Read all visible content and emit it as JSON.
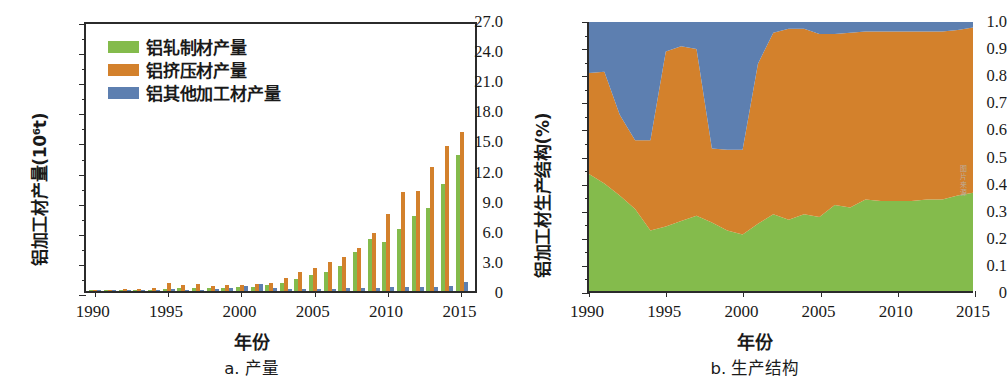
{
  "figure": {
    "series_colors": {
      "rolled": "#84bb4c",
      "extruded": "#d3812c",
      "other": "#5d7fb0"
    },
    "axis_color": "#2b2b2b",
    "watermark": "图片来源"
  },
  "legend": {
    "items": [
      {
        "label": "铝轧制材产量",
        "color_key": "rolled",
        "icon": "legend-swatch"
      },
      {
        "label": "铝挤压材产量",
        "color_key": "extruded",
        "icon": "legend-swatch"
      },
      {
        "label": "铝其他加工材产量",
        "color_key": "other",
        "icon": "legend-swatch"
      }
    ]
  },
  "panel_a": {
    "caption": "a. 产量",
    "xlabel": "年份",
    "ylabel": "铝加工材产量(10⁶t)",
    "yticks": [
      "0",
      "3.0",
      "6.0",
      "9.0",
      "12.0",
      "15.0",
      "18.0",
      "21.0",
      "24.0",
      "27.0"
    ],
    "xticks": [
      "1990",
      "1995",
      "2000",
      "2005",
      "2010",
      "2015"
    ]
  },
  "panel_b": {
    "caption": "b. 生产结构",
    "xlabel": "年份",
    "ylabel": "铝加工材生产结构(%)",
    "yticks": [
      "0",
      "0.1",
      "0.2",
      "0.3",
      "0.4",
      "0.5",
      "0.6",
      "0.7",
      "0.8",
      "0.9",
      "1.0"
    ],
    "xticks": [
      "1990",
      "1995",
      "2000",
      "2005",
      "2010",
      "2015"
    ]
  },
  "chart_data": [
    {
      "type": "bar",
      "id": "panel-a-production",
      "title": "a. 产量",
      "xlabel": "年份",
      "ylabel": "铝加工材产量(10⁶t)",
      "ylim": [
        0,
        27.0
      ],
      "xlim": [
        1989.4,
        2016.2
      ],
      "grid": false,
      "legend_position": "top-left",
      "grouped": true,
      "categories": [
        1990,
        1991,
        1992,
        1993,
        1994,
        1995,
        1996,
        1997,
        1998,
        1999,
        2000,
        2001,
        2002,
        2003,
        2004,
        2005,
        2006,
        2007,
        2008,
        2009,
        2010,
        2011,
        2012,
        2013,
        2014,
        2015
      ],
      "series": [
        {
          "name": "铝轧制材产量",
          "color": "#84bb4c",
          "values": [
            0.09,
            0.09,
            0.1,
            0.12,
            0.14,
            0.22,
            0.26,
            0.28,
            0.26,
            0.3,
            0.36,
            0.44,
            0.55,
            0.8,
            1.17,
            1.62,
            1.92,
            2.48,
            3.88,
            5.18,
            4.9,
            6.15,
            7.5,
            8.25,
            10.7,
            13.6,
            15.1
          ]
        },
        {
          "name": "铝挤压材产量",
          "color": "#d3812c",
          "values": [
            0.14,
            0.15,
            0.18,
            0.22,
            0.28,
            0.8,
            0.62,
            0.72,
            0.52,
            0.58,
            0.6,
            0.7,
            0.8,
            1.28,
            1.85,
            2.3,
            2.88,
            3.35,
            4.32,
            5.78,
            7.7,
            9.9,
            9.98,
            12.4,
            14.4,
            15.8,
            20.5,
            23.2,
            25.4
          ]
        },
        {
          "name": "铝其他加工材产量",
          "color": "#5d7fb0",
          "values": [
            0.06,
            0.06,
            0.07,
            0.07,
            0.08,
            0.22,
            0.1,
            0.11,
            0.25,
            0.3,
            0.45,
            0.72,
            0.3,
            0.22,
            0.23,
            0.24,
            0.25,
            0.26,
            0.3,
            0.34,
            0.36,
            0.36,
            0.38,
            0.4,
            0.45,
            0.9,
            1.3
          ]
        }
      ]
    },
    {
      "type": "area",
      "id": "panel-b-structure",
      "title": "b. 生产结构",
      "xlabel": "年份",
      "ylabel": "铝加工材生产结构(%)",
      "ylim": [
        0,
        1.0
      ],
      "xlim": [
        1990,
        2015
      ],
      "grid": false,
      "stacked": true,
      "normalized": true,
      "x": [
        1990,
        1991,
        1992,
        1993,
        1994,
        1995,
        1996,
        1997,
        1998,
        1999,
        2000,
        2001,
        2002,
        2003,
        2004,
        2005,
        2006,
        2007,
        2008,
        2009,
        2010,
        2011,
        2012,
        2013,
        2014,
        2015
      ],
      "series": [
        {
          "name": "铝轧制材产量",
          "color": "#84bb4c",
          "values": [
            0.435,
            0.4,
            0.355,
            0.305,
            0.225,
            0.24,
            0.26,
            0.28,
            0.255,
            0.225,
            0.21,
            0.25,
            0.285,
            0.265,
            0.285,
            0.275,
            0.32,
            0.31,
            0.34,
            0.335,
            0.335,
            0.335,
            0.34,
            0.34,
            0.355,
            0.365
          ]
        },
        {
          "name": "铝挤压材产量",
          "color": "#d3812c",
          "values": [
            0.375,
            0.415,
            0.3,
            0.255,
            0.335,
            0.65,
            0.65,
            0.62,
            0.275,
            0.3,
            0.315,
            0.595,
            0.675,
            0.71,
            0.69,
            0.68,
            0.635,
            0.65,
            0.625,
            0.63,
            0.63,
            0.63,
            0.625,
            0.625,
            0.615,
            0.615
          ]
        },
        {
          "name": "铝其他加工材产量",
          "color": "#5d7fb0",
          "values": [
            0.19,
            0.185,
            0.345,
            0.44,
            0.44,
            0.11,
            0.09,
            0.1,
            0.47,
            0.475,
            0.475,
            0.155,
            0.04,
            0.025,
            0.025,
            0.045,
            0.045,
            0.04,
            0.035,
            0.035,
            0.035,
            0.035,
            0.035,
            0.035,
            0.03,
            0.02
          ]
        }
      ]
    }
  ]
}
